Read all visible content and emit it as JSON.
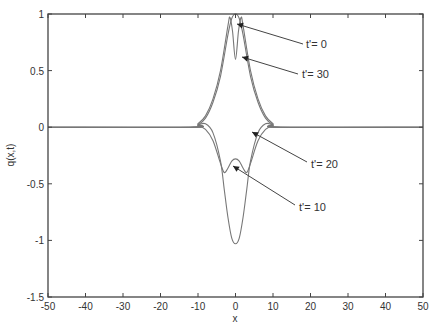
{
  "chart_data": {
    "type": "line",
    "title": "",
    "xlabel": "x",
    "ylabel": "q(x,t)",
    "xlim": [
      -50,
      50
    ],
    "ylim": [
      -1.5,
      1
    ],
    "grid": false,
    "legend": "none (curves labeled by arrow annotations)",
    "x_ticks": [
      "-50",
      "-40",
      "-30",
      "-20",
      "-10",
      "0",
      "10",
      "20",
      "30",
      "40",
      "50"
    ],
    "y_ticks": [
      "-1.5",
      "-1",
      "-0.5",
      "0",
      "0.5",
      "1"
    ],
    "series": [
      {
        "name": "t'= 0",
        "description": "single positive hump centered at x=0, peak ~1.0, width ~ +/-10",
        "x": [
          -50,
          -12,
          -10,
          -8,
          -6,
          -4,
          -2,
          -1,
          0,
          1,
          2,
          4,
          6,
          8,
          10,
          12,
          50
        ],
        "y": [
          0,
          0,
          0.02,
          0.08,
          0.22,
          0.45,
          0.82,
          0.96,
          1.0,
          0.96,
          0.82,
          0.45,
          0.22,
          0.08,
          0.02,
          0,
          0
        ]
      },
      {
        "name": "t'= 30",
        "description": "double peak near 0.97 at x~+/-1.5 with dip to ~0.6 at x=0",
        "x": [
          -50,
          -12,
          -10,
          -8,
          -6,
          -4,
          -2,
          -1.5,
          -0.8,
          0,
          0.8,
          1.5,
          2,
          4,
          6,
          8,
          10,
          12,
          50
        ],
        "y": [
          0,
          0,
          0.03,
          0.1,
          0.25,
          0.5,
          0.9,
          0.97,
          0.85,
          0.6,
          0.85,
          0.97,
          0.9,
          0.5,
          0.25,
          0.1,
          0.03,
          0,
          0
        ]
      },
      {
        "name": "t'= 20",
        "description": "negative double dip to ~-0.4 at x~+/-3 with local max ~-0.3 at 0",
        "x": [
          -50,
          -12,
          -10,
          -8,
          -6,
          -4,
          -3,
          -2,
          -1,
          0,
          1,
          2,
          3,
          4,
          6,
          8,
          10,
          12,
          50
        ],
        "y": [
          0,
          0,
          0.01,
          -0.02,
          -0.12,
          -0.32,
          -0.4,
          -0.36,
          -0.3,
          -0.28,
          -0.3,
          -0.36,
          -0.4,
          -0.32,
          -0.12,
          -0.02,
          0.01,
          0,
          0
        ]
      },
      {
        "name": "t'= 10",
        "description": "deep negative hump centered at x=0, min ~-1.03",
        "x": [
          -50,
          -12,
          -10,
          -8,
          -6,
          -4,
          -3,
          -2,
          -1,
          0,
          1,
          2,
          3,
          4,
          6,
          8,
          10,
          12,
          50
        ],
        "y": [
          0,
          0,
          0.02,
          0.03,
          -0.05,
          -0.3,
          -0.55,
          -0.8,
          -0.98,
          -1.03,
          -0.98,
          -0.8,
          -0.55,
          -0.3,
          -0.05,
          0.03,
          0.02,
          0,
          0
        ]
      }
    ],
    "annotations": [
      {
        "text": "t'= 0",
        "arrow_to": [
          0,
          0.95
        ]
      },
      {
        "text": "t'= 30",
        "arrow_to": [
          2,
          0.6
        ]
      },
      {
        "text": "t'= 20",
        "arrow_to": [
          3,
          -0.2
        ]
      },
      {
        "text": "t'= 10",
        "arrow_to": [
          0,
          -0.33
        ]
      }
    ]
  },
  "labels": {
    "xlabel": "x",
    "ylabel": "q(x,t)",
    "annot_t0": "t'= 0",
    "annot_t30": "t'= 30",
    "annot_t20": "t'= 20",
    "annot_t10": "t'= 10"
  },
  "colors": {
    "curve": "#777777",
    "axis": "#444444",
    "text": "#333333"
  }
}
